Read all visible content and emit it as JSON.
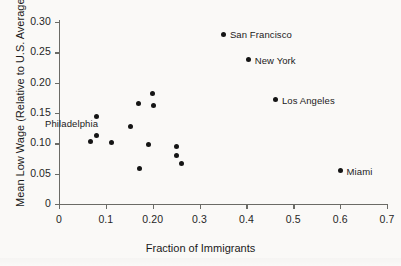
{
  "chart_data": {
    "type": "scatter",
    "title": "",
    "xlabel": "Fraction of Immigrants",
    "ylabel": "Mean Low Wage (Relative to U.S. Average)",
    "xlim": [
      0,
      0.7
    ],
    "ylim": [
      0,
      0.3
    ],
    "grid": false,
    "legend": "none",
    "xticks": [
      "0",
      "0.1",
      "0.20",
      "0.3",
      "0.4",
      "0.5",
      "0.6",
      "0.7"
    ],
    "xtickvalues": [
      0,
      0.1,
      0.2,
      0.3,
      0.4,
      0.5,
      0.6,
      0.7
    ],
    "yticks": [
      "0",
      "0.05",
      "0.10",
      "0.15",
      "0.20",
      "0.25",
      "0.30"
    ],
    "ytickvalues": [
      0,
      0.05,
      0.1,
      0.15,
      0.2,
      0.25,
      0.3
    ],
    "points": [
      {
        "label": "San Francisco",
        "x": 0.352,
        "y": 0.28,
        "label_pos": "right"
      },
      {
        "label": "New York",
        "x": 0.405,
        "y": 0.238,
        "label_pos": "right"
      },
      {
        "label": "Los Angeles",
        "x": 0.463,
        "y": 0.172,
        "label_pos": "right"
      },
      {
        "label": "Miami",
        "x": 0.601,
        "y": 0.055,
        "label_pos": "right"
      },
      {
        "label": "Philadelphia",
        "x": 0.079,
        "y": 0.113,
        "label_pos": "upper-left"
      },
      {
        "label": "",
        "x": 0.08,
        "y": 0.144,
        "label_pos": ""
      },
      {
        "label": "",
        "x": 0.068,
        "y": 0.103,
        "label_pos": ""
      },
      {
        "label": "",
        "x": 0.113,
        "y": 0.101,
        "label_pos": ""
      },
      {
        "label": "",
        "x": 0.153,
        "y": 0.128,
        "label_pos": ""
      },
      {
        "label": "",
        "x": 0.17,
        "y": 0.166,
        "label_pos": ""
      },
      {
        "label": "",
        "x": 0.2,
        "y": 0.182,
        "label_pos": ""
      },
      {
        "label": "",
        "x": 0.202,
        "y": 0.162,
        "label_pos": ""
      },
      {
        "label": "",
        "x": 0.19,
        "y": 0.098,
        "label_pos": ""
      },
      {
        "label": "",
        "x": 0.171,
        "y": 0.059,
        "label_pos": ""
      },
      {
        "label": "",
        "x": 0.25,
        "y": 0.095,
        "label_pos": ""
      },
      {
        "label": "",
        "x": 0.251,
        "y": 0.08,
        "label_pos": ""
      },
      {
        "label": "",
        "x": 0.261,
        "y": 0.067,
        "label_pos": ""
      }
    ]
  }
}
